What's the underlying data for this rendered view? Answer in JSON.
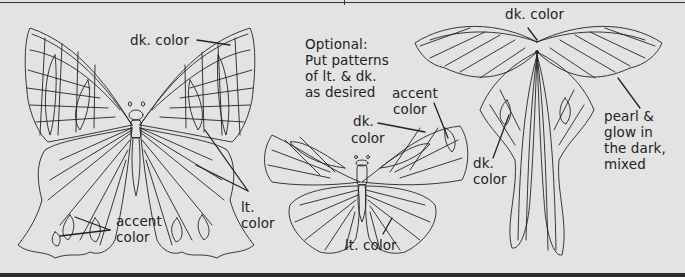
{
  "diagram": {
    "type": "coloring-guide-illustration",
    "background": "#e3e3e3",
    "line_color": "#222222",
    "figures": [
      {
        "name": "swallowtail-butterfly",
        "labels": {
          "dk_color": "dk. color",
          "lt_color_1": "lt.",
          "lt_color_2": "color",
          "accent_1": "accent",
          "accent_2": "color"
        }
      },
      {
        "name": "small-butterfly",
        "labels": {
          "optional_1": "Optional:",
          "optional_2": "Put patterns",
          "optional_3": "of lt. & dk.",
          "optional_4": "as desired",
          "accent_1": "accent",
          "accent_2": "color",
          "dk_1": "dk.",
          "dk_2": "color",
          "lt_color": "lt. color"
        }
      },
      {
        "name": "luna-moth",
        "labels": {
          "dk_color_top": "dk. color",
          "dk_1": "dk.",
          "dk_2": "color",
          "pearl_1": "pearl &",
          "pearl_2": "glow in",
          "pearl_3": "the dark,",
          "pearl_4": "mixed"
        }
      }
    ]
  }
}
